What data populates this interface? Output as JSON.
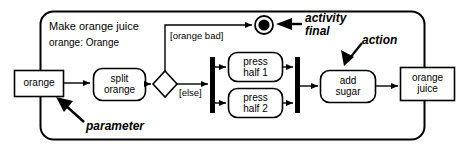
{
  "diagram": {
    "type": "uml-activity-diagram",
    "colors": {
      "stroke": "#000000",
      "fill": "#ffffff",
      "background": "#ffffff"
    },
    "frame": {
      "title": "Make orange juice",
      "subtitle": "orange: Orange"
    },
    "parameters": [
      {
        "id": "input",
        "label": "orange"
      },
      {
        "id": "output",
        "label": "orange\njuice"
      }
    ],
    "actions": [
      {
        "id": "split",
        "label": "split\norange"
      },
      {
        "id": "press1",
        "label": "press\nhalf 1"
      },
      {
        "id": "press2",
        "label": "press\nhalf 2"
      },
      {
        "id": "sugar",
        "label": "add\nsugar"
      }
    ],
    "control_nodes": [
      {
        "id": "decision",
        "kind": "decision"
      },
      {
        "id": "fork",
        "kind": "fork"
      },
      {
        "id": "join",
        "kind": "join"
      },
      {
        "id": "final",
        "kind": "activity-final"
      }
    ],
    "guards": [
      {
        "id": "guard-orange-bad",
        "label": "[orange bad]"
      },
      {
        "id": "guard-else",
        "label": "[else]"
      }
    ],
    "annotations": [
      {
        "id": "activity-final",
        "label": "activity\nfinal"
      },
      {
        "id": "action",
        "label": "action"
      },
      {
        "id": "parameter",
        "label": "parameter"
      }
    ]
  }
}
